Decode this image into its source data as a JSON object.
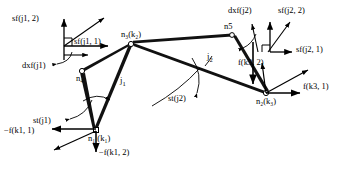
{
  "figure": {
    "type": "structural-mechanics-node-joint-diagram",
    "background_color": "#ffffff",
    "line_color": "#000000",
    "text_color": "#000000"
  },
  "nodes": [
    {
      "id": "n1",
      "label": "n",
      "sub": "1",
      "paren": "(k",
      "paren_sub": "1",
      "paren_end": ")",
      "x": 96,
      "y": 131
    },
    {
      "id": "n4",
      "label": "n",
      "sub": "4",
      "paren": "",
      "paren_sub": "",
      "paren_end": "",
      "x": 83,
      "y": 70
    },
    {
      "id": "n3",
      "label": "n",
      "sub": "3",
      "paren": "(k",
      "paren_sub": "2",
      "paren_end": ")",
      "x": 130,
      "y": 42
    },
    {
      "id": "n5",
      "label": "n5",
      "sub": "",
      "paren": "",
      "paren_sub": "",
      "paren_end": "",
      "x": 231,
      "y": 35
    },
    {
      "id": "n2",
      "label": "n",
      "sub": "2",
      "paren": "(k",
      "paren_sub": "3",
      "paren_end": ")",
      "x": 266,
      "y": 95
    }
  ],
  "node_labels": {
    "n1": "n₁ (k₁)",
    "n4": "n₄",
    "n3": "n₃(k₂)",
    "n5": "n5",
    "n2": "n₂(k₃)"
  },
  "members": [
    {
      "from": "n1",
      "to": "n4"
    },
    {
      "from": "n4",
      "to": "n3"
    },
    {
      "from": "n1",
      "to": "n3"
    },
    {
      "from": "n3",
      "to": "n5"
    },
    {
      "from": "n3",
      "to": "n2"
    },
    {
      "from": "n5",
      "to": "n2"
    }
  ],
  "joint_labels": [
    {
      "name": "j1",
      "text": "j",
      "sub": "1",
      "x": 122,
      "y": 82
    },
    {
      "name": "j2",
      "text": "j",
      "sub": "2",
      "x": 208,
      "y": 60
    }
  ],
  "arc_labels": [
    {
      "name": "st-j1",
      "text": "st(j1)",
      "x": 46,
      "y": 110
    },
    {
      "name": "st-j2",
      "text": "st(j2)",
      "x": 181,
      "y": 97
    }
  ],
  "frame_j1": {
    "name": "local-frame-j1",
    "origin_x": 64,
    "origin_y": 46,
    "labels": [
      {
        "name": "sf-j1-2",
        "text": "sf(j1, 2)",
        "x": 14,
        "y": 18
      },
      {
        "name": "sf-j1-1",
        "text": "sf(j1, 1)",
        "x": 74,
        "y": 42
      },
      {
        "name": "dxf-j1",
        "text": "dxf(j1)",
        "x": 24,
        "y": 65
      }
    ]
  },
  "frame_j2": {
    "name": "local-frame-j2",
    "origin_x": 270,
    "origin_y": 52,
    "labels": [
      {
        "name": "dxf-j2",
        "text": "dxf(j2)",
        "x": 229,
        "y": 10
      },
      {
        "name": "sf-j2-2",
        "text": "sf(j2, 2)",
        "x": 280,
        "y": 10
      },
      {
        "name": "sf-j2-1",
        "text": "sf(j2, 1)",
        "x": 296,
        "y": 49
      },
      {
        "name": "f-k3-2",
        "text": "f(k3, 2)",
        "x": 242,
        "y": 62
      }
    ]
  },
  "force_labels": [
    {
      "name": "neg-f-k1-1",
      "text": "−f(k1, 1)",
      "x": 6,
      "y": 131
    },
    {
      "name": "neg-f-k1-2",
      "text": "−f(k1, 2)",
      "x": 100,
      "y": 152
    },
    {
      "name": "f-k3-1",
      "text": "f(k3, 1)",
      "x": 303,
      "y": 86
    }
  ]
}
